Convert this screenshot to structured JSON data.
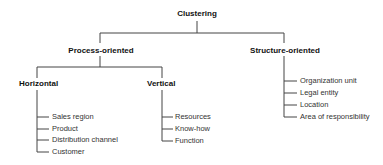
{
  "diagram": {
    "root": "Clustering",
    "branches": [
      {
        "label": "Process-oriented",
        "children": [
          {
            "label": "Horizontal",
            "items": [
              "Sales region",
              "Product",
              "Distribution channel",
              "Customer"
            ]
          },
          {
            "label": "Vertical",
            "items": [
              "Resources",
              "Know-how",
              "Function"
            ]
          }
        ]
      },
      {
        "label": "Structure-oriented",
        "items": [
          "Organization unit",
          "Legal entity",
          "Location",
          "Area of responsibility"
        ]
      }
    ]
  }
}
